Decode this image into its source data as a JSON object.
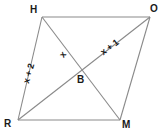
{
  "figure": {
    "kind": "geometry-diagram",
    "shape_name": "HORM",
    "background_color": "#ffffff",
    "line_color": "#808080",
    "label_color": "#1a1a1a",
    "vertices": [
      {
        "name": "H",
        "label": "H",
        "x": 42,
        "y": 17,
        "label_x": 30,
        "label_y": 5
      },
      {
        "name": "O",
        "label": "O",
        "x": 150,
        "y": 17,
        "label_x": 150,
        "label_y": 4
      },
      {
        "name": "R",
        "label": "R",
        "x": 18,
        "y": 120,
        "label_x": 4,
        "label_y": 119
      },
      {
        "name": "M",
        "label": "M",
        "x": 120,
        "y": 120,
        "label_x": 122,
        "label_y": 120
      },
      {
        "name": "B",
        "label": "B",
        "x": 78,
        "y": 68,
        "label_x": 77,
        "label_y": 75
      }
    ],
    "sides": [
      {
        "name": "HO",
        "from": "H",
        "to": "O"
      },
      {
        "name": "OM",
        "from": "O",
        "to": "M"
      },
      {
        "name": "MR",
        "from": "M",
        "to": "R"
      },
      {
        "name": "RH",
        "from": "R",
        "to": "H"
      }
    ],
    "diagonals": [
      {
        "name": "HM",
        "from": "H",
        "to": "M"
      },
      {
        "name": "RO",
        "from": "R",
        "to": "O"
      }
    ],
    "measure_labels": [
      {
        "name": "side-rh-length",
        "text": "x + 2",
        "x": 22,
        "y": 82,
        "rotation": -74
      },
      {
        "name": "segment-hb-length",
        "text": "x",
        "x": 58,
        "y": 54,
        "rotation": -52
      },
      {
        "name": "segment-bo-length",
        "text": "x + 1",
        "x": 99,
        "y": 50,
        "rotation": -37
      }
    ]
  }
}
